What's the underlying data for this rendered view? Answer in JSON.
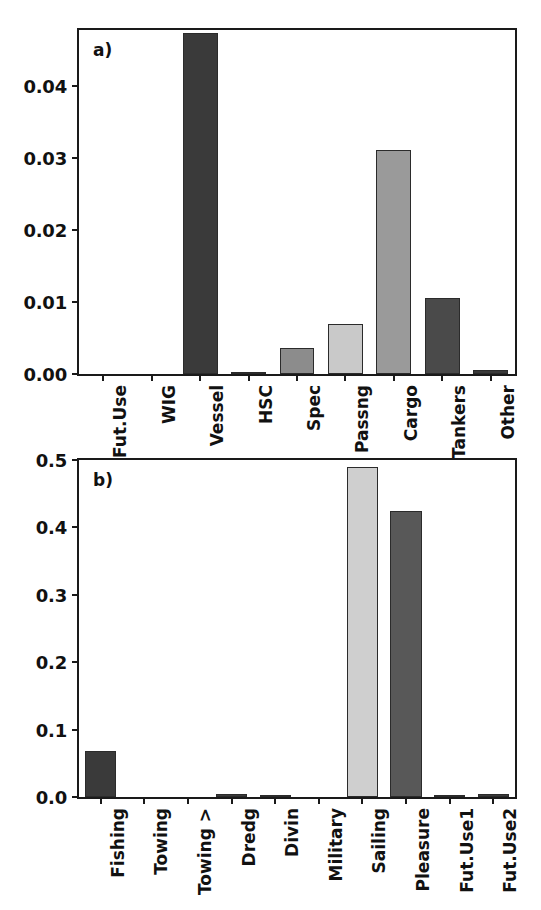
{
  "figure": {
    "width": 541,
    "height": 910,
    "background": "#ffffff",
    "panel_count": 2
  },
  "panels": [
    {
      "tag": "a)",
      "yticks": [
        "0.00",
        "0.01",
        "0.02",
        "0.03",
        "0.04"
      ],
      "ytick_values": [
        0.0,
        0.01,
        0.02,
        0.03,
        0.04
      ],
      "ylim": [
        0,
        0.0477
      ],
      "categories": [
        "Fut.Use",
        "WIG",
        "Vessel",
        "HSC",
        "Spec",
        "Passng",
        "Cargo",
        "Tankers",
        "Other"
      ],
      "values": [
        0.0,
        0.0,
        0.0473,
        0.0002,
        0.0036,
        0.007,
        0.0311,
        0.0105,
        0.0006
      ],
      "bar_colors": [
        "#3a3a3a",
        "#3a3a3a",
        "#3a3a3a",
        "#3a3a3a",
        "#8c8c8c",
        "#c9c9c9",
        "#9a9a9a",
        "#4a4a4a",
        "#3a3a3a"
      ]
    },
    {
      "tag": "b)",
      "yticks": [
        "0.0",
        "0.1",
        "0.2",
        "0.3",
        "0.4",
        "0.5"
      ],
      "ytick_values": [
        0.0,
        0.1,
        0.2,
        0.3,
        0.4,
        0.5
      ],
      "ylim": [
        0,
        0.5
      ],
      "categories": [
        "Fishing",
        "Towing",
        "Towing >",
        "Dredg",
        "Divin",
        "Military",
        "Sailing",
        "Pleasure",
        "Fut.Use1",
        "Fut.Use2"
      ],
      "values": [
        0.069,
        0.0,
        0.0,
        0.005,
        0.002,
        0.0,
        0.49,
        0.425,
        0.0005,
        0.005
      ],
      "bar_colors": [
        "#3a3a3a",
        "#3a3a3a",
        "#3a3a3a",
        "#3a3a3a",
        "#3a3a3a",
        "#3a3a3a",
        "#cfcfcf",
        "#585858",
        "#3a3a3a",
        "#3a3a3a"
      ]
    }
  ],
  "chart_data": [
    {
      "type": "bar",
      "title": "a)",
      "xlabel": "",
      "ylabel": "",
      "categories": [
        "Fut.Use",
        "WIG",
        "Vessel",
        "HSC",
        "Spec",
        "Passng",
        "Cargo",
        "Tankers",
        "Other"
      ],
      "values": [
        0.0,
        0.0,
        0.0473,
        0.0002,
        0.0036,
        0.007,
        0.0311,
        0.0105,
        0.0006
      ],
      "ylim": [
        0,
        0.0477
      ],
      "yticks": [
        0.0,
        0.01,
        0.02,
        0.03,
        0.04
      ],
      "ytick_labels": [
        "0.00",
        "0.01",
        "0.02",
        "0.03",
        "0.04"
      ],
      "grid": false,
      "legend": "none",
      "annotations": [
        "a)"
      ]
    },
    {
      "type": "bar",
      "title": "b)",
      "xlabel": "",
      "ylabel": "",
      "categories": [
        "Fishing",
        "Towing",
        "Towing >",
        "Dredg",
        "Divin",
        "Military",
        "Sailing",
        "Pleasure",
        "Fut.Use1",
        "Fut.Use2"
      ],
      "values": [
        0.069,
        0.0,
        0.0,
        0.005,
        0.002,
        0.0,
        0.49,
        0.425,
        0.0005,
        0.005
      ],
      "ylim": [
        0,
        0.5
      ],
      "yticks": [
        0.0,
        0.1,
        0.2,
        0.3,
        0.4,
        0.5
      ],
      "ytick_labels": [
        "0.0",
        "0.1",
        "0.2",
        "0.3",
        "0.4",
        "0.5"
      ],
      "grid": false,
      "legend": "none",
      "annotations": [
        "b)"
      ]
    }
  ]
}
